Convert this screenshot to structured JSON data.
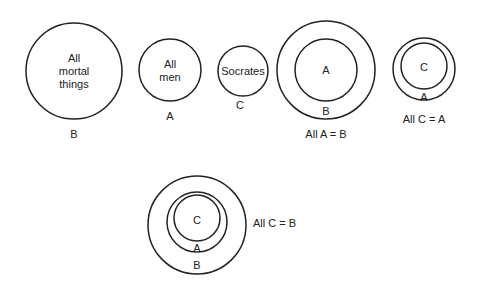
{
  "diagram": {
    "set1": {
      "lines": [
        "All",
        "mortal",
        "things"
      ],
      "label": "B"
    },
    "set2": {
      "lines": [
        "All",
        "men"
      ],
      "label": "A"
    },
    "set3": {
      "text": "Socrates",
      "label": "C"
    },
    "venn1": {
      "inner": "A",
      "outer": "B",
      "caption": "All A = B"
    },
    "venn2": {
      "inner": "C",
      "outer": "A",
      "caption": "All C = A"
    },
    "venn3": {
      "inner": "C",
      "middle": "A",
      "outer": "B",
      "caption": "All C = B"
    }
  }
}
